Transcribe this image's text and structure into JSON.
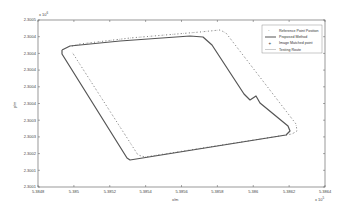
{
  "chart_data": {
    "type": "line",
    "title": "",
    "xlabel": "x/m",
    "ylabel": "y/m",
    "x_exponent": "x 10^5",
    "y_exponent": "x 10^6",
    "x_ticks": [
      "5.3848",
      "5.385",
      "5.3852",
      "5.3854",
      "5.3856",
      "5.3858",
      "5.386",
      "5.3862",
      "5.3864"
    ],
    "y_ticks": [
      "2.3005",
      "2.3004",
      "2.3004",
      "2.3004",
      "2.3004",
      "2.3004",
      "2.3003",
      "2.3003",
      "2.3002",
      "2.3001",
      "2.3001"
    ],
    "xlim": [
      5.3848,
      5.3864
    ],
    "ylim": [
      2.3001,
      2.3005
    ],
    "grid": false,
    "legend_position": "upper right",
    "legend": [
      "Reference Point Position",
      "Proposed Method",
      "Image Matched point",
      "Testing Route"
    ],
    "series": [
      {
        "name": "Proposed Method",
        "style": "solid",
        "points_px": [
          [
            62,
            50
          ],
          [
            70,
            46
          ],
          [
            120,
            41
          ],
          [
            190,
            36
          ],
          [
            203,
            37
          ],
          [
            212,
            45
          ],
          [
            244,
            94
          ],
          [
            250,
            100
          ],
          [
            256,
            96
          ],
          [
            260,
            103
          ],
          [
            288,
            126
          ],
          [
            290,
            131
          ],
          [
            286,
            135
          ],
          [
            130,
            160
          ],
          [
            127,
            158
          ],
          [
            62,
            54
          ],
          [
            62,
            50
          ]
        ]
      },
      {
        "name": "Image Matched point",
        "style": "markers",
        "points_px": [
          [
            72,
            46
          ],
          [
            80,
            44
          ],
          [
            130,
            38
          ],
          [
            200,
            32
          ],
          [
            220,
            30
          ],
          [
            226,
            33
          ],
          [
            296,
            124
          ],
          [
            297,
            131
          ],
          [
            292,
            134
          ],
          [
            145,
            157
          ],
          [
            138,
            155
          ],
          [
            72,
            52
          ]
        ]
      },
      {
        "name": "Testing Route",
        "style": "dotted",
        "points_px": [
          [
            72,
            46
          ],
          [
            80,
            44
          ],
          [
            130,
            38
          ],
          [
            200,
            32
          ],
          [
            220,
            30
          ],
          [
            226,
            33
          ],
          [
            296,
            124
          ],
          [
            297,
            131
          ],
          [
            292,
            134
          ],
          [
            145,
            157
          ],
          [
            138,
            155
          ],
          [
            72,
            52
          ]
        ]
      }
    ]
  },
  "axes": {
    "xlabel": "x/m",
    "ylabel": "y/m",
    "x_exponent": "x 10",
    "x_exponent_power": "5",
    "y_exponent": "x 10",
    "y_exponent_power": "6"
  },
  "legend": {
    "items": [
      {
        "label": "Reference Point Position",
        "marker": "·"
      },
      {
        "label": "Proposed Method",
        "marker": "line"
      },
      {
        "label": "Image Matched point",
        "marker": "+"
      },
      {
        "label": "Testing Route",
        "marker": "thin-line"
      }
    ]
  }
}
